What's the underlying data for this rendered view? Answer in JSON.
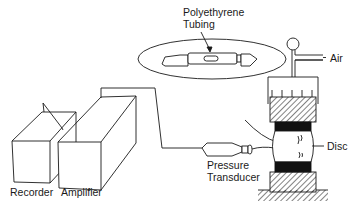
{
  "diagram": {
    "type": "apparatus-schematic",
    "labels": {
      "tubing_line1": "Polyethyrene",
      "tubing_line2": "Tubing",
      "air": "Air",
      "disc": "Disc",
      "transducer_line1": "Pressure",
      "transducer_line2": "Transducer",
      "recorder": "Recorder",
      "amplifier": "Amplifier"
    },
    "colors": {
      "stroke": "#1a1a1a",
      "background": "#ffffff",
      "fill_dark": "#111111"
    }
  }
}
